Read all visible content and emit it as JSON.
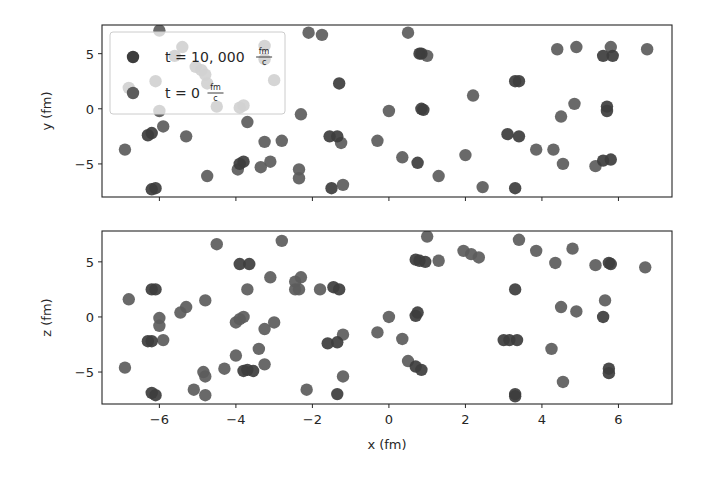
{
  "chart_data": [
    {
      "type": "scatter",
      "title": "",
      "xlabel": "",
      "ylabel": "y (fm)",
      "xlim": [
        -7.5,
        7.4
      ],
      "ylim": [
        -8.0,
        7.6
      ],
      "xticks": [
        -6,
        -4,
        -2,
        0,
        2,
        4,
        6
      ],
      "xtick_labels_visible": false,
      "yticks": [
        -5,
        0,
        5
      ],
      "ytick_labels": [
        "−5",
        "0",
        "5"
      ],
      "grid": false,
      "legend": {
        "position": "upper left",
        "entries": [
          {
            "label": "t = 10, 000",
            "unit_num": "fm",
            "unit_den": "c",
            "color": "#3d3d3d"
          },
          {
            "label": "t = 0",
            "unit_num": "fm",
            "unit_den": "c",
            "color": "#5c5c5c"
          }
        ]
      },
      "series": [
        {
          "name": "t = 10,000 fm/c",
          "color": "#3d3d3d",
          "points": [
            [
              0.8,
              5.0
            ],
            [
              0.85,
              5.0
            ],
            [
              -1.3,
              2.3
            ],
            [
              0.85,
              0.0
            ],
            [
              0.9,
              -0.1
            ],
            [
              -1.55,
              -2.5
            ],
            [
              -1.35,
              -2.5
            ],
            [
              0.75,
              -4.9
            ],
            [
              -1.5,
              -7.2
            ],
            [
              5.6,
              4.8
            ],
            [
              5.85,
              4.8
            ],
            [
              3.3,
              2.5
            ],
            [
              3.4,
              2.5
            ],
            [
              5.7,
              0.2
            ],
            [
              5.7,
              -0.2
            ],
            [
              3.1,
              -2.3
            ],
            [
              3.4,
              -2.5
            ],
            [
              5.6,
              -4.7
            ],
            [
              5.8,
              -4.6
            ],
            [
              3.3,
              -7.2
            ],
            [
              -6.3,
              -2.4
            ],
            [
              -6.2,
              -2.2
            ],
            [
              -3.9,
              -5.0
            ],
            [
              -3.8,
              -4.8
            ],
            [
              -6.2,
              -7.3
            ],
            [
              -6.1,
              -7.2
            ]
          ]
        },
        {
          "name": "t = 0 fm/c",
          "color": "#5c5c5c",
          "points": [
            [
              -2.1,
              6.9
            ],
            [
              -1.75,
              6.7
            ],
            [
              0.5,
              6.9
            ],
            [
              1.0,
              4.8
            ],
            [
              2.2,
              1.2
            ],
            [
              -2.3,
              -0.5
            ],
            [
              0.0,
              -0.2
            ],
            [
              -1.25,
              -3.1
            ],
            [
              -0.3,
              -2.9
            ],
            [
              0.35,
              -4.4
            ],
            [
              2.0,
              -4.2
            ],
            [
              -2.35,
              -5.5
            ],
            [
              -2.35,
              -6.3
            ],
            [
              -1.2,
              -6.9
            ],
            [
              1.3,
              -6.1
            ],
            [
              2.45,
              -7.1
            ],
            [
              4.4,
              5.4
            ],
            [
              4.9,
              5.6
            ],
            [
              5.8,
              5.6
            ],
            [
              6.75,
              5.4
            ],
            [
              4.85,
              0.45
            ],
            [
              4.5,
              -0.7
            ],
            [
              3.85,
              -3.7
            ],
            [
              4.3,
              -3.7
            ],
            [
              4.55,
              -5.0
            ],
            [
              5.4,
              -5.2
            ],
            [
              -5.9,
              -1.6
            ],
            [
              -5.3,
              -2.5
            ],
            [
              -6.9,
              -3.7
            ],
            [
              -3.7,
              -1.2
            ],
            [
              -3.25,
              -3.0
            ],
            [
              -2.8,
              -2.9
            ],
            [
              -3.95,
              -5.5
            ],
            [
              -3.35,
              -5.3
            ],
            [
              -3.1,
              -4.8
            ],
            [
              -4.75,
              -6.1
            ],
            [
              -6.0,
              -0.2
            ],
            [
              -6.0,
              7.1
            ],
            [
              -6.8,
              1.9
            ],
            [
              -6.1,
              2.5
            ],
            [
              -5.6,
              4.8
            ],
            [
              -5.4,
              5.6
            ],
            [
              -5.05,
              3.8
            ],
            [
              -4.9,
              3.5
            ],
            [
              -4.8,
              3.1
            ],
            [
              -4.75,
              2.3
            ],
            [
              -3.25,
              5.7
            ],
            [
              -3.25,
              4.5
            ],
            [
              -3.0,
              2.6
            ],
            [
              -4.5,
              0.2
            ],
            [
              -3.9,
              0.1
            ],
            [
              -3.8,
              0.3
            ]
          ]
        }
      ]
    },
    {
      "type": "scatter",
      "title": "",
      "xlabel": "x (fm)",
      "ylabel": "z (fm)",
      "xlim": [
        -7.5,
        7.4
      ],
      "ylim": [
        -7.9,
        7.8
      ],
      "xticks": [
        -6,
        -4,
        -2,
        0,
        2,
        4,
        6
      ],
      "xtick_labels": [
        "−6",
        "−4",
        "−2",
        "0",
        "2",
        "4",
        "6"
      ],
      "yticks": [
        -5,
        0,
        5
      ],
      "ytick_labels": [
        "−5",
        "0",
        "5"
      ],
      "grid": false,
      "series": [
        {
          "name": "t = 10,000 fm/c",
          "color": "#3d3d3d",
          "points": [
            [
              -3.9,
              4.8
            ],
            [
              -3.65,
              4.8
            ],
            [
              -6.2,
              2.5
            ],
            [
              -6.1,
              2.5
            ],
            [
              -6.3,
              -2.2
            ],
            [
              -6.2,
              -2.2
            ],
            [
              -3.8,
              -4.9
            ],
            [
              -3.7,
              -4.8
            ],
            [
              -3.55,
              -4.9
            ],
            [
              -6.2,
              -6.9
            ],
            [
              -6.1,
              -7.1
            ],
            [
              0.7,
              5.2
            ],
            [
              0.8,
              5.1
            ],
            [
              0.95,
              5.0
            ],
            [
              -1.45,
              2.7
            ],
            [
              -1.3,
              2.5
            ],
            [
              0.7,
              0.1
            ],
            [
              0.75,
              0.4
            ],
            [
              -1.6,
              -2.4
            ],
            [
              -1.35,
              -2.3
            ],
            [
              0.7,
              -4.5
            ],
            [
              0.85,
              -4.8
            ],
            [
              -1.35,
              -7.0
            ],
            [
              5.75,
              4.9
            ],
            [
              5.8,
              4.8
            ],
            [
              3.3,
              2.5
            ],
            [
              5.6,
              0
            ],
            [
              3.0,
              -2.1
            ],
            [
              3.15,
              -2.1
            ],
            [
              3.35,
              -2.1
            ],
            [
              5.75,
              -4.7
            ],
            [
              5.75,
              -5.1
            ],
            [
              3.3,
              -7.0
            ],
            [
              3.3,
              -7.2
            ]
          ]
        },
        {
          "name": "t = 0 fm/c",
          "color": "#5c5c5c",
          "points": [
            [
              -4.5,
              6.6
            ],
            [
              -2.8,
              6.9
            ],
            [
              -3.1,
              3.6
            ],
            [
              -3.7,
              2.5
            ],
            [
              -2.45,
              3.2
            ],
            [
              -2.45,
              2.5
            ],
            [
              -6.8,
              1.6
            ],
            [
              -4.8,
              1.5
            ],
            [
              -5.3,
              0.9
            ],
            [
              -5.45,
              0.4
            ],
            [
              -6.0,
              -0.1
            ],
            [
              -6.0,
              -0.8
            ],
            [
              -3.9,
              -0.2
            ],
            [
              -3.8,
              0
            ],
            [
              -4.0,
              -0.5
            ],
            [
              -3.25,
              -1.1
            ],
            [
              -3.0,
              -0.5
            ],
            [
              -5.9,
              -2.1
            ],
            [
              -3.4,
              -2.9
            ],
            [
              -4.0,
              -3.5
            ],
            [
              -3.25,
              -4.3
            ],
            [
              -4.3,
              -4.7
            ],
            [
              -4.85,
              -5.0
            ],
            [
              -4.8,
              -5.4
            ],
            [
              -6.9,
              -4.6
            ],
            [
              -5.1,
              -6.6
            ],
            [
              -4.8,
              -7.1
            ],
            [
              1.0,
              7.3
            ],
            [
              1.3,
              5.1
            ],
            [
              1.95,
              6.0
            ],
            [
              2.15,
              5.7
            ],
            [
              2.35,
              5.4
            ],
            [
              -2.3,
              3.6
            ],
            [
              -2.35,
              2.5
            ],
            [
              -1.8,
              2.5
            ],
            [
              0,
              0
            ],
            [
              -0.3,
              -1.4
            ],
            [
              0.35,
              -2.0
            ],
            [
              -1.2,
              -1.6
            ],
            [
              0.5,
              -4.0
            ],
            [
              -1.2,
              -5.4
            ],
            [
              -2.15,
              -6.6
            ],
            [
              3.4,
              7.0
            ],
            [
              3.85,
              6.0
            ],
            [
              4.8,
              6.2
            ],
            [
              4.35,
              4.9
            ],
            [
              5.4,
              4.7
            ],
            [
              6.7,
              4.5
            ],
            [
              4.5,
              0.9
            ],
            [
              4.9,
              0.5
            ],
            [
              5.65,
              1.5
            ],
            [
              4.25,
              -2.9
            ],
            [
              4.55,
              -5.9
            ]
          ]
        }
      ]
    }
  ]
}
